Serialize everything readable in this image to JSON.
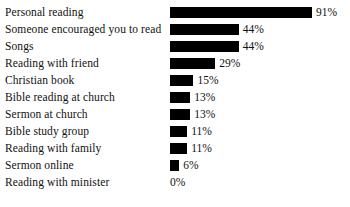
{
  "chart_data": {
    "type": "bar",
    "title": "",
    "subtitle": "",
    "xlabel": "",
    "ylabel": "",
    "orientation": "horizontal",
    "grid": false,
    "legend": false,
    "xlim": [
      0,
      91
    ],
    "value_suffix": "%",
    "bar_color": "#000000",
    "background_color": "#ffffff",
    "text_color": "#111111",
    "categories": [
      "Personal reading",
      "Someone encouraged you to read",
      "Songs",
      "Reading with friend",
      "Christian book",
      "Bible reading at church",
      "Sermon at church",
      "Bible study group",
      "Reading with family",
      "Sermon online",
      "Reading with minister"
    ],
    "values": [
      91,
      44,
      44,
      29,
      15,
      13,
      13,
      11,
      11,
      6,
      0
    ],
    "value_labels": [
      "91%",
      "44%",
      "44%",
      "29%",
      "15%",
      "13%",
      "13%",
      "11%",
      "11%",
      "6%",
      "0%"
    ],
    "rows": [
      {
        "label": "Personal reading",
        "value": 91,
        "value_label": "91%"
      },
      {
        "label": "Someone encouraged you to read",
        "value": 44,
        "value_label": "44%"
      },
      {
        "label": "Songs",
        "value": 44,
        "value_label": "44%"
      },
      {
        "label": "Reading with friend",
        "value": 29,
        "value_label": "29%"
      },
      {
        "label": "Christian book",
        "value": 15,
        "value_label": "15%"
      },
      {
        "label": "Bible reading at church",
        "value": 13,
        "value_label": "13%"
      },
      {
        "label": "Sermon at church",
        "value": 13,
        "value_label": "13%"
      },
      {
        "label": "Bible study group",
        "value": 11,
        "value_label": "11%"
      },
      {
        "label": "Reading with family",
        "value": 11,
        "value_label": "11%"
      },
      {
        "label": "Sermon online",
        "value": 6,
        "value_label": "6%"
      },
      {
        "label": "Reading with minister",
        "value": 0,
        "value_label": "0%"
      }
    ]
  }
}
